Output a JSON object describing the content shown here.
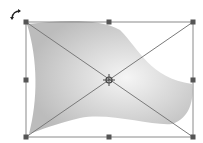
{
  "canvas": {
    "width": 203,
    "height": 143,
    "background": "#ffffff"
  },
  "shape": {
    "type": "flag-wave",
    "fill_center": "#f4f4f4",
    "fill_edge": "#bdbdbd"
  },
  "selection": {
    "bounding_box": {
      "x1": 26,
      "y1": 22,
      "x2": 193,
      "y2": 137
    },
    "line_color": "#8a8a8a",
    "handle_color": "#555555",
    "handles": [
      {
        "name": "top-left",
        "x": 26,
        "y": 22
      },
      {
        "name": "top-middle",
        "x": 109,
        "y": 22
      },
      {
        "name": "top-right",
        "x": 193,
        "y": 22
      },
      {
        "name": "middle-left",
        "x": 26,
        "y": 80
      },
      {
        "name": "middle-right",
        "x": 193,
        "y": 80
      },
      {
        "name": "bottom-left",
        "x": 26,
        "y": 137
      },
      {
        "name": "bottom-middle",
        "x": 109,
        "y": 137
      },
      {
        "name": "bottom-right",
        "x": 193,
        "y": 137
      }
    ],
    "center": {
      "x": 109,
      "y": 80
    }
  },
  "rotate_icon": {
    "name": "rotate-icon",
    "x": 15,
    "y": 13
  }
}
